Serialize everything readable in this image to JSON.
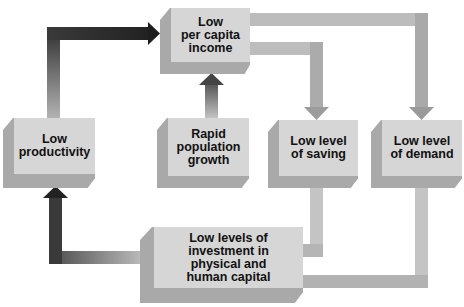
{
  "diagram": {
    "nodes": {
      "income": {
        "lines": [
          "Low",
          "per capita",
          "income"
        ]
      },
      "productivity": {
        "lines": [
          "Low",
          "productivity"
        ]
      },
      "population": {
        "lines": [
          "Rapid",
          "population",
          "growth"
        ]
      },
      "saving": {
        "lines": [
          "Low level",
          "of saving"
        ]
      },
      "demand": {
        "lines": [
          "Low level",
          "of demand"
        ]
      },
      "investment": {
        "lines": [
          "Low levels of",
          "investment in",
          "physical and",
          "human capital"
        ]
      }
    },
    "edges": [
      {
        "from": "productivity",
        "to": "income"
      },
      {
        "from": "population",
        "to": "income"
      },
      {
        "from": "income",
        "to": "saving"
      },
      {
        "from": "income",
        "to": "demand"
      },
      {
        "from": "saving",
        "to": "investment"
      },
      {
        "from": "demand",
        "to": "investment"
      },
      {
        "from": "investment",
        "to": "productivity"
      }
    ],
    "colors": {
      "box_face": "#d6d6d6",
      "box_side": "#a9a9a9",
      "arrow_dark": "#2a2a2a",
      "arrow_light": "#a8a8a8"
    }
  }
}
